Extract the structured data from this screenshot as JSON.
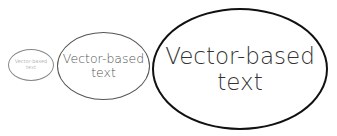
{
  "diagram": {
    "shape": "ellipse",
    "items": [
      {
        "size": "small",
        "label": "Vector-based\ntext"
      },
      {
        "size": "medium",
        "label": "Vector-based\ntext"
      },
      {
        "size": "large",
        "label": "Vector-based\ntext"
      }
    ]
  }
}
